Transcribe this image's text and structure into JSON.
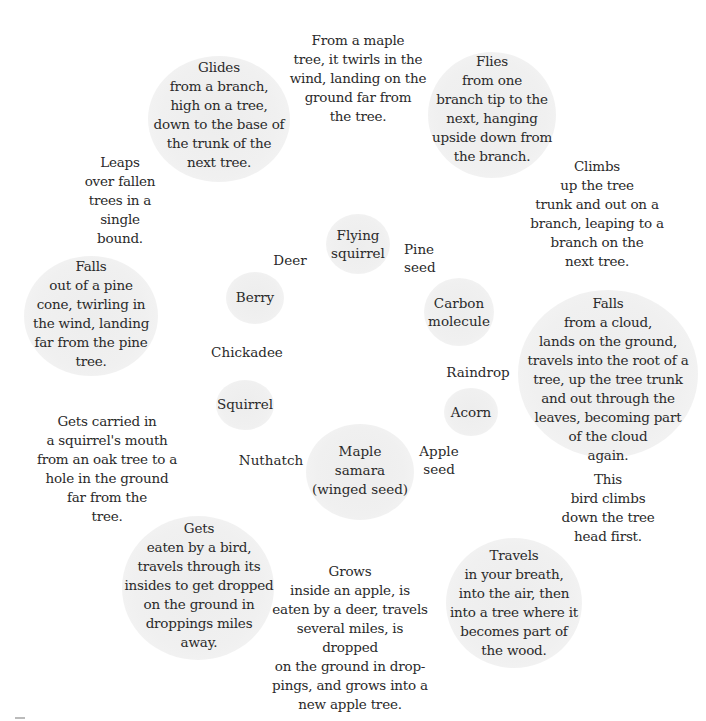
{
  "descriptions": {
    "glides": "Glides\nfrom a branch,\nhigh on a tree,\ndown to the base of\nthe trunk of the\nnext tree.",
    "maple_twirls": "From a maple\ntree, it twirls in the\nwind, landing on the\nground far from\nthe tree.",
    "flies": "Flies\nfrom one\nbranch tip to the\nnext, hanging\nupside down from\nthe branch.",
    "leaps": "Leaps\nover fallen\ntrees in a single\nbound.",
    "climbs_up": "Climbs\nup the tree\ntrunk and out on a\nbranch, leaping to a\nbranch on the\nnext tree.",
    "falls_pine": "Falls\nout of a pine\ncone, twirling in\nthe wind, landing\nfar from the pine\ntree.",
    "falls_cloud": "Falls\nfrom a cloud,\nlands on the ground,\ntravels into the root of a\ntree, up the tree trunk\nand out through the\nleaves, becoming part\nof the cloud\nagain.",
    "carried_squirrel": "Gets carried in\na squirrel's mouth\nfrom an oak tree to a\nhole in the ground\nfar from the\ntree.",
    "bird_climbs_down": "This\nbird climbs\ndown the tree\nhead first.",
    "eaten_bird": "Gets\neaten by a bird,\ntravels through its\ninsides to get dropped\non the ground in\ndroppings miles\naway.",
    "grows_apple": "Grows\ninside an apple, is\neaten by a deer, travels\nseveral miles, is dropped\non the ground in drop-\npings, and grows into a\nnew apple tree.",
    "travels_breath": "Travels\nin your breath,\ninto the air, then\ninto a tree where it\nbecomes part of\nthe wood."
  },
  "items": {
    "flying_squirrel": "Flying\nsquirrel",
    "deer": "Deer",
    "pine_seed": "Pine\nseed",
    "berry": "Berry",
    "carbon_molecule": "Carbon\nmolecule",
    "chickadee": "Chickadee",
    "raindrop": "Raindrop",
    "squirrel": "Squirrel",
    "acorn": "Acorn",
    "nuthatch": "Nuthatch",
    "maple_samara": "Maple\nsamara\n(winged seed)",
    "apple_seed": "Apple\nseed"
  },
  "colors": {
    "circle_fill": "#efefef",
    "text": "#2a2a2a",
    "background": "#ffffff"
  }
}
